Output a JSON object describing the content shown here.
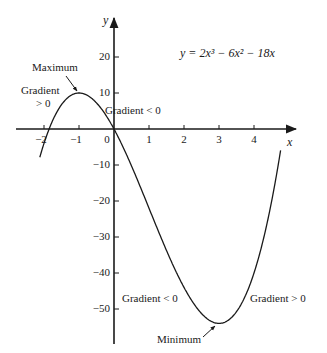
{
  "equation": "y = 2x³ − 6x² − 18x",
  "axes": {
    "x_label": "x",
    "y_label": "y",
    "x_ticks": [
      {
        "v": -2,
        "label": "−2"
      },
      {
        "v": -1,
        "label": "−1"
      },
      {
        "v": 0,
        "label": "0"
      },
      {
        "v": 1,
        "label": "1"
      },
      {
        "v": 2,
        "label": "2"
      },
      {
        "v": 3,
        "label": "3"
      },
      {
        "v": 4,
        "label": "4"
      }
    ],
    "y_ticks": [
      {
        "v": 20,
        "label": "20"
      },
      {
        "v": 10,
        "label": "10"
      },
      {
        "v": -10,
        "label": "−10"
      },
      {
        "v": -20,
        "label": "−20"
      },
      {
        "v": -30,
        "label": "−30"
      },
      {
        "v": -40,
        "label": "−40"
      },
      {
        "v": -50,
        "label": "−50"
      }
    ]
  },
  "annotations": {
    "maximum": "Maximum",
    "minimum": "Minimum",
    "gradient_pos_left_1": "Gradient",
    "gradient_pos_left_2": "> 0",
    "gradient_neg_top": "Gradient  < 0",
    "gradient_neg_bottom": "Gradient  < 0",
    "gradient_pos_right": "Gradient  > 0"
  },
  "chart_data": {
    "type": "line",
    "title": "y = 2x³ − 6x² − 18x",
    "xlabel": "x",
    "ylabel": "y",
    "xlim": [
      -2.2,
      5.1
    ],
    "ylim": [
      -59,
      31
    ],
    "grid": false,
    "series": [
      {
        "name": "y = 2x^3 - 6x^2 - 18x",
        "x": [
          -2.1,
          -2,
          -1.5,
          -1,
          -0.5,
          0,
          0.5,
          1,
          1.5,
          2,
          2.5,
          3,
          3.5,
          4,
          4.5,
          4.77
        ],
        "y": [
          -8.3,
          -4,
          6.75,
          10,
          6.25,
          0,
          -10.25,
          -22,
          -33.75,
          -44,
          -50.75,
          -54,
          -52.25,
          -44,
          -28.25,
          -2.9
        ]
      }
    ],
    "points": [
      {
        "label": "Maximum",
        "x": -1,
        "y": 10
      },
      {
        "label": "Minimum",
        "x": 3,
        "y": -54
      }
    ],
    "regions": [
      {
        "label": "Gradient > 0",
        "x_range": [
          -2,
          -1
        ]
      },
      {
        "label": "Gradient < 0",
        "x_range": [
          -1,
          3
        ]
      },
      {
        "label": "Gradient > 0",
        "x_range": [
          3,
          4.77
        ]
      }
    ]
  }
}
